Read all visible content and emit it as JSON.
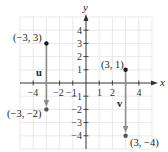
{
  "figure": {
    "title": "",
    "axes": {
      "x_label": "x",
      "y_label": "y",
      "x_range": [
        -5,
        5
      ],
      "y_range": [
        -5,
        5
      ],
      "x_ticks": [
        {
          "value": -4,
          "label": "−4"
        },
        {
          "value": -2,
          "label": "−2"
        },
        {
          "value": -1,
          "label": "−1"
        },
        {
          "value": 1,
          "label": "1"
        },
        {
          "value": 2,
          "label": "2"
        },
        {
          "value": 4,
          "label": "4"
        }
      ],
      "y_ticks": [
        {
          "value": 4,
          "label": "4"
        },
        {
          "value": 3,
          "label": "3"
        },
        {
          "value": 2,
          "label": "2"
        },
        {
          "value": 1,
          "label": "1"
        },
        {
          "value": -1,
          "label": "−1"
        },
        {
          "value": -2,
          "label": "−2"
        },
        {
          "value": -3,
          "label": "−3"
        },
        {
          "value": -4,
          "label": "−4"
        }
      ],
      "grid": true
    },
    "vectors": [
      {
        "name": "u",
        "label": "u",
        "start": {
          "x": -3,
          "y": 3,
          "label": "(−3, 3)"
        },
        "end": {
          "x": -3,
          "y": -2,
          "label": "(−3, −2)"
        }
      },
      {
        "name": "v",
        "label": "v",
        "start": {
          "x": 3,
          "y": 1,
          "label": "(3, 1)"
        },
        "end": {
          "x": 3,
          "y": -4,
          "label": "(3, −4)"
        }
      }
    ],
    "colors": {
      "grid": "#e3e3e3",
      "axis": "#333333",
      "vector": "#8c8c8c",
      "point": "#1a1a1a"
    }
  }
}
